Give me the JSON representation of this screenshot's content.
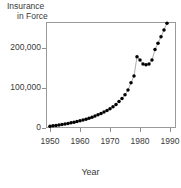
{
  "chart_data": {
    "type": "scatter",
    "title": "",
    "ylabel_line1": "Insurance",
    "ylabel_line2": "in Force",
    "xlabel": "Year",
    "grid": false,
    "legend": "none",
    "xlim": [
      1949,
      1991
    ],
    "ylim": [
      0,
      265000
    ],
    "xticks": [
      1950,
      1960,
      1970,
      1980,
      1990
    ],
    "xtick_labels": [
      "1950",
      "1960",
      "1970",
      "1980",
      "1990"
    ],
    "yticks": [
      0,
      100000,
      200000
    ],
    "ytick_labels": [
      "0",
      "100,000",
      "200,000"
    ],
    "marker": "filled-circle",
    "marker_color": "#000000",
    "line_color": "#8a8a8a",
    "x": [
      1950,
      1951,
      1952,
      1953,
      1954,
      1955,
      1956,
      1957,
      1958,
      1959,
      1960,
      1961,
      1962,
      1963,
      1964,
      1965,
      1966,
      1967,
      1968,
      1969,
      1970,
      1971,
      1972,
      1973,
      1974,
      1975,
      1976,
      1977,
      1978,
      1979,
      1980,
      1981,
      1982,
      1983,
      1984,
      1985,
      1986,
      1987,
      1988,
      1989
    ],
    "values": [
      4500,
      5500,
      6500,
      7500,
      8500,
      10000,
      11500,
      13000,
      14500,
      16000,
      18000,
      20000,
      22000,
      24500,
      27000,
      30000,
      33000,
      36500,
      40000,
      44000,
      48000,
      53000,
      59000,
      66000,
      74000,
      83000,
      95000,
      113000,
      130000,
      178000,
      170000,
      160000,
      158000,
      160000,
      170000,
      196000,
      212000,
      228000,
      245000,
      262000
    ]
  },
  "axes": {
    "ytick_label_0": "0",
    "ytick_label_1": "100,000",
    "ytick_label_2": "200,000"
  }
}
